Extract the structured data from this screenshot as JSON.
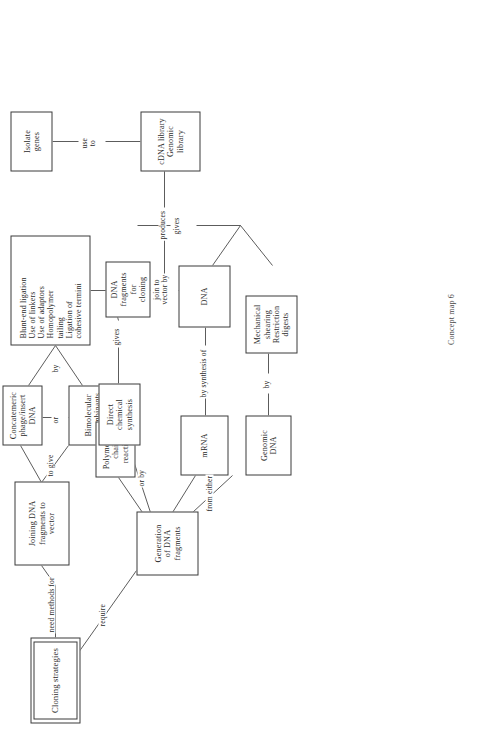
{
  "document": {
    "caption": "Concept map 6",
    "title": "Cloning strategies concept map"
  },
  "nodes": {
    "root": {
      "label": "Cloning strategies"
    },
    "joining": {
      "label": "Joining DNA\nfragments to\nvector"
    },
    "concatemeric": {
      "label": "Concatemeric\nphage/insert DNA"
    },
    "bimolecular": {
      "label": "Bimolecular\nrecombinants"
    },
    "methods": {
      "label": "Blunt-end ligation\nUse of linkers\nUse of adaptors\nHomopolymer\ntailing\nLigation of\ncohesive termini"
    },
    "isolate": {
      "label": "Isolate\ngenes"
    },
    "library": {
      "label": "cDNA library\nGenomic library"
    },
    "generation": {
      "label": "Generation\nof DNA\nfragments"
    },
    "pcr": {
      "label": "Polymerase\nchain\nreaction"
    },
    "synthesis": {
      "label": "Direct\nchemical\nsynthesis"
    },
    "mrna": {
      "label": "mRNA"
    },
    "genomic_dna": {
      "label": "Genomic\nDNA"
    },
    "dna": {
      "label": "DNA"
    },
    "shearing": {
      "label": "Mechanical\nshearing\nRestriction\ndigests"
    },
    "fragments_for_cloning": {
      "label": "DNA fragments\nfor\ncloning"
    }
  },
  "edge_labels": {
    "need_methods_for": "need methods for",
    "to_give": "to give",
    "or": "or",
    "by": "by",
    "join_to_vector_by": "join to\nvector by",
    "produces": "produces",
    "use_to": "use\nto",
    "require": "require",
    "or_by": "or by",
    "from_either": "from either",
    "gives_synthesis": "gives",
    "gives_fragments": "gives",
    "by_synthesis_of": "by synthesis of",
    "by_digest": "by"
  },
  "colors": {
    "stroke": "#3a3a3a",
    "text": "#2b2b2b",
    "background": "#ffffff"
  }
}
